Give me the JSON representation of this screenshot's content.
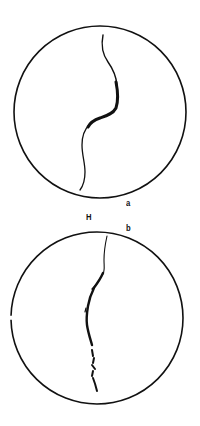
{
  "figure": {
    "panels": [
      {
        "id": "a",
        "label": "a",
        "circle": {
          "cx": 100,
          "cy": 112,
          "r": 86
        },
        "crack_description": "continuous sinuous crack, thick in upper-middle section"
      },
      {
        "id": "b",
        "label": "b",
        "circle": {
          "cx": 97,
          "cy": 318,
          "r": 86
        },
        "crack_description": "segmented crack with small branching offsets in lower section"
      }
    ],
    "between_label": "H"
  },
  "colors": {
    "stroke": "#111111",
    "background": "#ffffff"
  }
}
